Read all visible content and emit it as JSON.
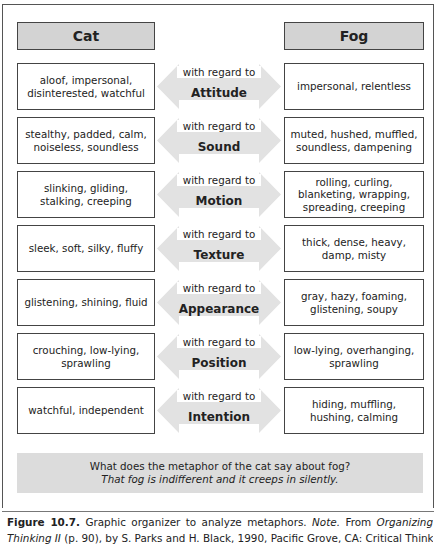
{
  "headers": {
    "left": "Cat",
    "right": "Fog"
  },
  "connector_prefix": "with regard to",
  "rows": [
    {
      "cat": "aloof, impersonal, disinterested, watchful",
      "aspect": "Attitude",
      "fog": "impersonal, relentless"
    },
    {
      "cat": "stealthy, padded, calm, noiseless, soundless",
      "aspect": "Sound",
      "fog": "muted, hushed, muffled, soundless, dampening"
    },
    {
      "cat": "slinking, gliding, stalking, creeping",
      "aspect": "Motion",
      "fog": "rolling, curling, blanketing, wrapping, spreading, creeping"
    },
    {
      "cat": "sleek, soft, silky, fluffy",
      "aspect": "Texture",
      "fog": "thick, dense, heavy, damp, misty"
    },
    {
      "cat": "glistening, shining, fluid",
      "aspect": "Appearance",
      "fog": "gray, hazy, foaming, glistening, soupy"
    },
    {
      "cat": "crouching, low-lying, sprawling",
      "aspect": "Position",
      "fog": "low-lying, overhanging, sprawling"
    },
    {
      "cat": "watchful, independent",
      "aspect": "Intention",
      "fog": "hiding, muffling, hushing, calming"
    }
  ],
  "question": {
    "prompt": "What does the metaphor of the cat say about fog?",
    "answer": "That fog is indifferent and it creeps in silently."
  },
  "caption": {
    "label": "Figure 10.7.",
    "text1": "Graphic organizer to analyze metaphors.",
    "note": "Note.",
    "from": "From",
    "book": "Organizing Thinking II",
    "rest": "(p. 90), by S. Parks and H. Black, 1990, Pacific Grove, CA: Critical Think-"
  },
  "colors": {
    "header_fill": "#d3d3d3",
    "arrow_fill": "#e2e2e2",
    "question_fill": "#dcdcdc",
    "border": "#444444"
  }
}
